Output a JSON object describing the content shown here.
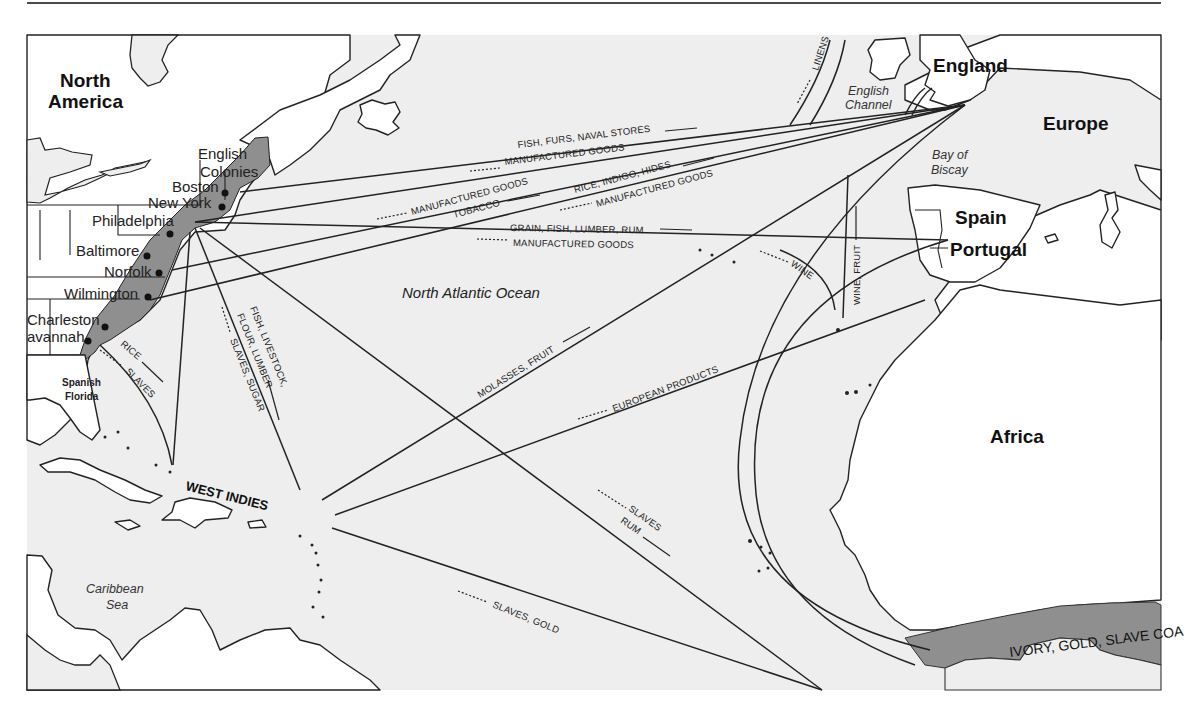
{
  "map": {
    "title": "Triangular Trade Routes — Colonial Atlantic",
    "regions": {
      "north_america": [
        "North",
        "America"
      ],
      "europe": "Europe",
      "africa": "Africa",
      "england": "England",
      "spain": "Spain",
      "portugal": "Portugal",
      "west_indies": "WEST INDIES",
      "english_colonies": [
        "English",
        "Colonies"
      ],
      "spanish_florida": [
        "Spanish",
        "Florida"
      ],
      "gold_coast": "IVORY, GOLD, SLAVE COA"
    },
    "water_bodies": {
      "north_atlantic": "North Atlantic Ocean",
      "caribbean": [
        "Caribbean",
        "Sea"
      ],
      "english_channel": [
        "English",
        "Channel"
      ],
      "bay_of_biscay": [
        "Bay of",
        "Biscay"
      ]
    },
    "cities": [
      "Boston",
      "New York",
      "Philadelphia",
      "Baltimore",
      "Norfolk",
      "Wilmington",
      "Charleston",
      "Savannah"
    ],
    "cities_display": {
      "boston": "Boston",
      "new_york": "New York",
      "philadelphia": "Philadelphia",
      "baltimore": "Baltimore",
      "norfolk": "Norfolk",
      "wilmington": "Wilmington",
      "charleston": "Charleston",
      "savannah": "avannah"
    },
    "trade_goods": {
      "fish_furs": "FISH, FURS, NAVAL STORES",
      "mfg_1": "MANUFACTURED GOODS",
      "mfg_2": "MANUFACTURED GOODS",
      "tobacco": "TOBACCO",
      "rice_indigo": "RICE, INDIGO, HIDES",
      "mfg_3": "MANUFACTURED GOODS",
      "grain_fish": "GRAIN, FISH, LUMBER, RUM",
      "mfg_4": "MANUFACTURED GOODS",
      "linens": "LINENS",
      "wine": "WINE",
      "wine_fruit": "WINE, FRUIT",
      "rice": "RICE",
      "slaves_fl": "SLAVES",
      "fish_livestock": "FISH, LIVESTOCK,",
      "flour_lumber": "FLOUR, LUMBER",
      "slaves_sugar": "SLAVES, SUGAR",
      "molasses": "MOLASSES, FRUIT",
      "european": "EUROPEAN PRODUCTS",
      "slaves_rum_1": "SLAVES",
      "slaves_rum_2": "RUM",
      "slaves_gold": "SLAVES, GOLD"
    },
    "colors": {
      "ocean": "#eeeeee",
      "land": "#ffffff",
      "colonies": "#8f8f8f",
      "lines": "#222222"
    }
  }
}
